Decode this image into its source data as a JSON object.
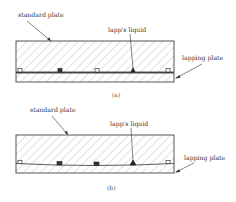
{
  "figure": {
    "panels": [
      {
        "id": "a",
        "caption": "(a)",
        "labels": {
          "standard_plate": "standard plate",
          "lapps_liquid": "lapp's liquid",
          "lapping_plate": "lapping plate"
        },
        "description": "Standard plate resting flat on lapping plate with abrasive particles in the gap"
      },
      {
        "id": "b",
        "caption": "(b)",
        "labels": {
          "standard_plate": "standard plate",
          "lapps_liquid": "lapp's liquid",
          "lapping_plate": "lapping plate"
        },
        "description": "Standard plate embedded with abrasive particles along curved interface"
      }
    ],
    "colors": {
      "outline": "#444444",
      "hatch": "#9a9a9a",
      "particle": "#222222",
      "text": "#333333"
    }
  }
}
